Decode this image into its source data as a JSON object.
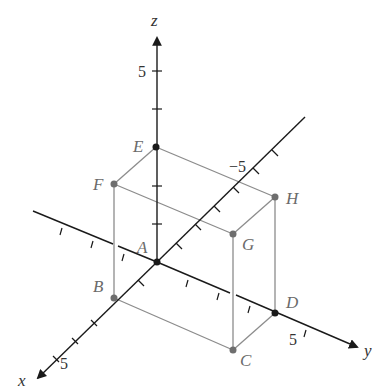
{
  "diagram": {
    "type": "3d-coordinate-box",
    "axes": {
      "x": {
        "label": "x",
        "tick_label": "5"
      },
      "y": {
        "label": "y",
        "tick_label_pos": "5",
        "tick_label_neg": "−5"
      },
      "z": {
        "label": "z",
        "tick_label": "5"
      }
    },
    "points": {
      "A": "A",
      "B": "B",
      "C": "C",
      "D": "D",
      "E": "E",
      "F": "F",
      "G": "G",
      "H": "H"
    },
    "colors": {
      "axis": "#1a1a1a",
      "box_edge": "#8c8c8c",
      "vertex": "#6e6e6e",
      "label": "#6a6a6a"
    }
  }
}
